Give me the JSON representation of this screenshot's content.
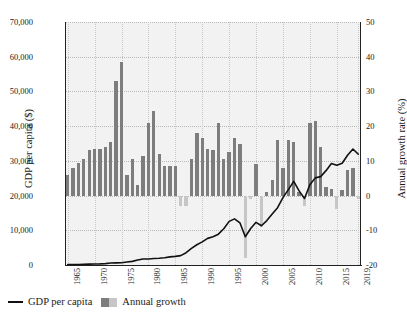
{
  "chart_data": {
    "type": "bar",
    "title": "",
    "xlabel": "",
    "ylabel": "GDP per capita ($)",
    "y2label": "Annual growth rate (%)",
    "ylim": [
      0,
      70000
    ],
    "y2lim": [
      -20,
      50
    ],
    "grid": true,
    "legend_position": "bottom-left",
    "x": [
      1965,
      1966,
      1967,
      1968,
      1969,
      1970,
      1971,
      1972,
      1973,
      1974,
      1975,
      1976,
      1977,
      1978,
      1979,
      1980,
      1981,
      1982,
      1983,
      1984,
      1985,
      1986,
      1987,
      1988,
      1989,
      1990,
      1991,
      1992,
      1993,
      1994,
      1995,
      1996,
      1997,
      1998,
      1999,
      2000,
      2001,
      2002,
      2003,
      2004,
      2005,
      2006,
      2007,
      2008,
      2009,
      2010,
      2011,
      2012,
      2013,
      2014,
      2015,
      2016,
      2017,
      2018,
      2019
    ],
    "xticks": [
      "1965",
      "1970",
      "1975",
      "1980",
      "1985",
      "1990",
      "1995",
      "2000",
      "2005",
      "2010",
      "2015",
      "2019"
    ],
    "yticks_left": [
      "0",
      "10,000",
      "20,000",
      "30,000",
      "40,000",
      "50,000",
      "60,000",
      "70,000"
    ],
    "yticks_right": [
      "-20",
      "-10",
      "0",
      "10",
      "20",
      "30",
      "40",
      "50"
    ],
    "series": [
      {
        "name": "Annual growth",
        "type": "bar",
        "axis": "right",
        "unit": "%",
        "color_positive": "#7d7d7d",
        "color_negative": "#c6c6c6",
        "values": [
          6.0,
          8.0,
          9.5,
          10.5,
          13.0,
          13.5,
          13.5,
          14.0,
          15.5,
          33.0,
          38.5,
          6.0,
          10.5,
          3.0,
          11.5,
          21.0,
          24.5,
          12.0,
          8.5,
          8.5,
          8.5,
          -3.0,
          -3.0,
          10.5,
          18.0,
          16.5,
          13.5,
          13.0,
          21.0,
          10.5,
          12.5,
          16.5,
          15.0,
          -18.0,
          -1.0,
          9.0,
          -9.0,
          1.0,
          4.5,
          16.0,
          8.0,
          16.0,
          15.5,
          1.0,
          -3.0,
          21.0,
          21.5,
          14.0,
          2.5,
          2.0,
          -4.0,
          1.5,
          7.5,
          8.0,
          -1.0
        ]
      },
      {
        "name": "GDP per capita",
        "type": "line",
        "axis": "left",
        "unit": "$",
        "color": "#111111",
        "values": [
          110,
          130,
          160,
          200,
          250,
          280,
          320,
          400,
          560,
          620,
          650,
          840,
          1050,
          1420,
          1750,
          1720,
          1870,
          1930,
          2080,
          2350,
          2480,
          2700,
          3550,
          4770,
          5830,
          6650,
          7670,
          8140,
          8880,
          10430,
          12570,
          13290,
          12160,
          8130,
          10500,
          12290,
          11310,
          12800,
          14680,
          16500,
          19400,
          21700,
          24100,
          21350,
          19150,
          23090,
          25100,
          25460,
          27180,
          29250,
          28730,
          29290,
          31600,
          33400,
          31900
        ]
      }
    ],
    "notes": {
      "zero_growth_alignment": "Right-axis 0% aligns with left-axis 20,000",
      "line_peak_right_axis_value": 46
    }
  },
  "legend": {
    "items": [
      {
        "label": "GDP per capita",
        "marker": "line"
      },
      {
        "label": "Annual growth",
        "marker": "swatch"
      }
    ]
  },
  "colors": {
    "plot_background": "#f2f2f2",
    "bar_positive": "#7d7d7d",
    "bar_negative": "#c6c6c6",
    "line": "#111111",
    "grid": "#b9b9b9",
    "axis": "#222222"
  }
}
